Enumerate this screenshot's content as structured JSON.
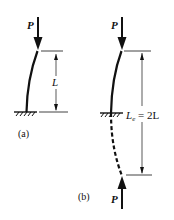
{
  "figure": {
    "panel_a": {
      "caption": "(a)",
      "load_label": "P",
      "length_label": "L",
      "support": "fixed base (hatched)",
      "load_direction": "down"
    },
    "panel_b": {
      "caption": "(b)",
      "load_label_top": "P",
      "load_label_bottom": "P",
      "effective_length_label": "L",
      "effective_length_subscript": "e",
      "effective_length_eq": " = 2L",
      "support": "fixed mid-point (hatched), mirrored extension dashed",
      "load_direction_top": "down",
      "load_direction_bottom": "up"
    },
    "colors": {
      "ink": "#111111",
      "background": "#ffffff"
    }
  }
}
